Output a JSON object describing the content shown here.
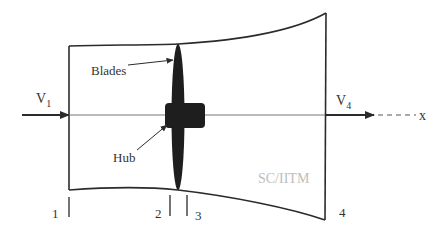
{
  "diagram": {
    "colors": {
      "line": "#2b2b2b",
      "fill_solid": "#1e1e1e",
      "axis": "#555555",
      "watermark": "#bdbdbd",
      "text": "#333333"
    },
    "labels": {
      "blades": "Blades",
      "hub": "Hub",
      "v1_main": "V",
      "v1_sub": "1",
      "v4_main": "V",
      "v4_sub": "4",
      "axis": "x",
      "watermark": "SC/IITM"
    },
    "stations": [
      {
        "id": "1",
        "label": "1",
        "x": 69
      },
      {
        "id": "2",
        "label": "2",
        "x": 170
      },
      {
        "id": "3",
        "label": "3",
        "x": 187
      },
      {
        "id": "4",
        "label": "4",
        "x": 325
      }
    ],
    "nodes": [
      {
        "id": "stream-tube",
        "type": "boundary",
        "label": ""
      },
      {
        "id": "blades",
        "type": "component",
        "label": "Blades"
      },
      {
        "id": "hub",
        "type": "component",
        "label": "Hub"
      },
      {
        "id": "inflow",
        "type": "velocity",
        "label": "V1"
      },
      {
        "id": "outflow",
        "type": "velocity",
        "label": "V4"
      },
      {
        "id": "x-axis",
        "type": "axis",
        "label": "x"
      }
    ],
    "edges": [
      {
        "from": "inflow",
        "to": "stream-tube",
        "kind": "arrow"
      },
      {
        "from": "stream-tube",
        "to": "outflow",
        "kind": "arrow"
      },
      {
        "from": "outflow",
        "to": "x-axis",
        "kind": "dashed"
      }
    ]
  }
}
